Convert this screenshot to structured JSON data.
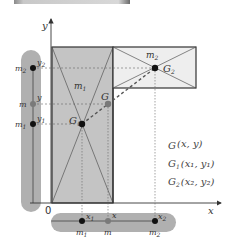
{
  "diagram": {
    "axes": {
      "x_label": "x",
      "y_label": "y",
      "origin_label": "0"
    },
    "bodies": {
      "m1": {
        "label": "m",
        "sub": "1",
        "centroid": "G",
        "centroid_sub": "1"
      },
      "m2": {
        "label": "m",
        "sub": "2",
        "centroid": "G",
        "centroid_sub": "2"
      },
      "combined": {
        "centroid": "G"
      }
    },
    "y_bar": {
      "items": [
        {
          "mass": "m",
          "mass_sub": "2",
          "coord": "y",
          "coord_sub": "2"
        },
        {
          "mass": "m",
          "mass_sub": "",
          "coord": "y",
          "coord_sub": ""
        },
        {
          "mass": "m",
          "mass_sub": "1",
          "coord": "y",
          "coord_sub": "1"
        }
      ]
    },
    "x_bar": {
      "items": [
        {
          "mass": "m",
          "mass_sub": "1",
          "coord": "x",
          "coord_sub": "1"
        },
        {
          "mass": "m",
          "mass_sub": "",
          "coord": "x",
          "coord_sub": ""
        },
        {
          "mass": "m",
          "mass_sub": "2",
          "coord": "x",
          "coord_sub": "2"
        }
      ]
    },
    "legend": [
      {
        "name": "G",
        "sub": "",
        "coords": "(x,  y)"
      },
      {
        "name": "G",
        "sub": "1",
        "coords": "(x₁, y₁)"
      },
      {
        "name": "G",
        "sub": "2",
        "coords": "(x₂, y₂)"
      }
    ],
    "colors": {
      "m1_fill": "#c4c4c4",
      "m2_fill": "#eeeeee",
      "bar_fill": "#b0b0b0",
      "outline": "#333333",
      "dot": "#111111",
      "g_dot": "#7a7a7a"
    }
  }
}
